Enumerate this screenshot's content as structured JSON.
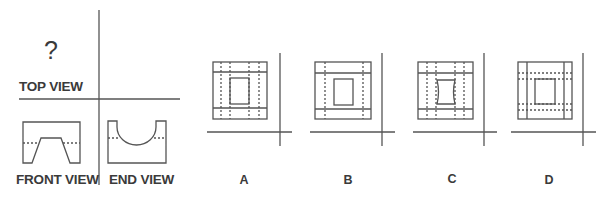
{
  "question": {
    "prompt_mark": "?",
    "views": {
      "top": "TOP VIEW",
      "front": "FRONT VIEW",
      "end": "END VIEW"
    }
  },
  "options": [
    {
      "label": "A",
      "description": "outer square, two solid horizontal lines, inner rectangle, four dashed vertical lines"
    },
    {
      "label": "B",
      "description": "outer square, two solid horizontal lines, inner rectangle, two dashed vertical lines"
    },
    {
      "label": "C",
      "description": "outer square, two solid horizontal lines, inner rectangle with curved sides, four dashed vertical lines"
    },
    {
      "label": "D",
      "description": "outer square, two solid vertical lines, inner rectangle, four dashed horizontal lines"
    }
  ],
  "colors": {
    "line": "#555555",
    "text": "#3a3a3a",
    "background": "#ffffff"
  }
}
